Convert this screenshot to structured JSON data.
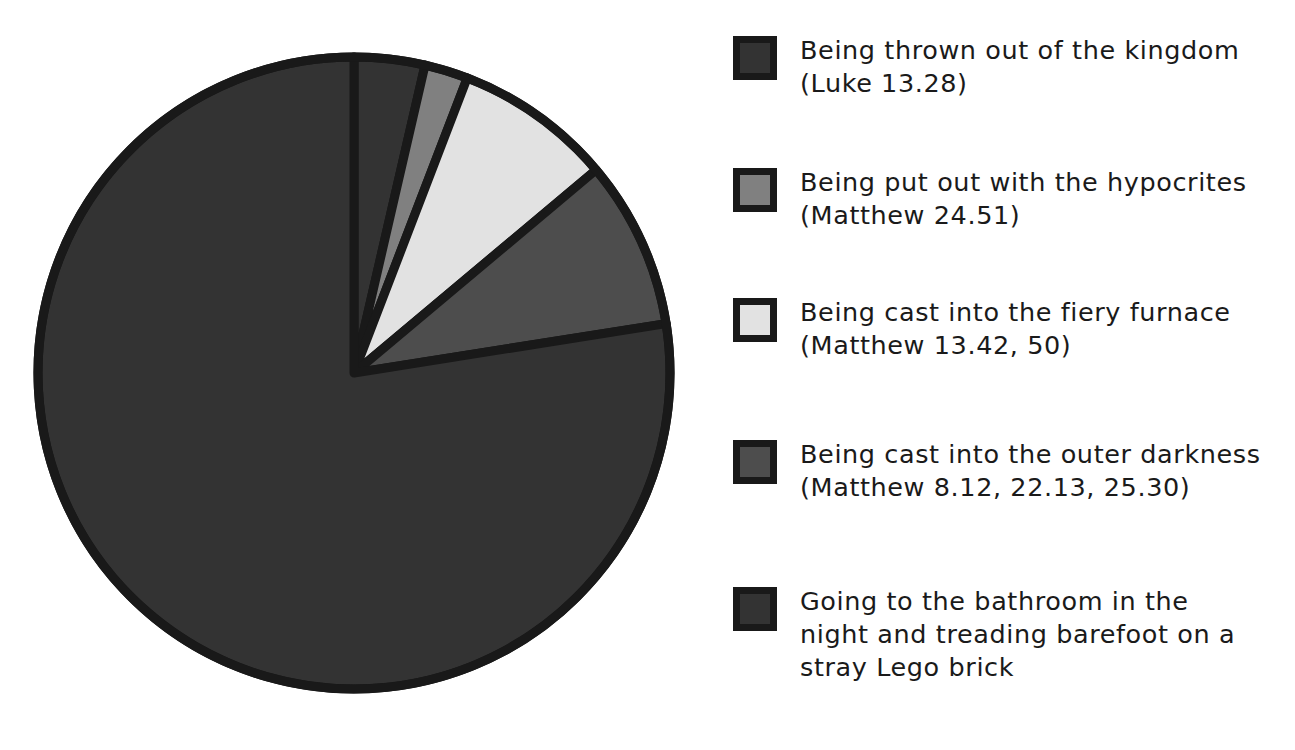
{
  "chart_data": {
    "type": "pie",
    "title": "",
    "subtitle": "",
    "xlabel": "",
    "ylabel": "",
    "legend_position": "right",
    "grid": false,
    "start_angle_deg": 0,
    "direction": "clockwise",
    "center": {
      "x": 354,
      "y": 373
    },
    "radius": 316,
    "categories": [
      "Being thrown out of the kingdom (Luke 13.28)",
      "Being put out with the hypocrites (Matthew 24.51)",
      "Being cast into the fiery furnace (Matthew 13.42, 50)",
      "Being cast into the outer darkness (Matthew 8.12, 22.13, 25.30)",
      "Going to the bathroom in the night and treading barefoot on a stray Lego brick"
    ],
    "values": [
      3.6,
      2.2,
      8.1,
      8.6,
      77.5
    ],
    "angles_deg": [
      13.0,
      8.0,
      29.0,
      31.0,
      279.0
    ],
    "colors": [
      "#333333",
      "#808080",
      "#e2e2e2",
      "#4d4d4d",
      "#333333"
    ],
    "stroke_color": "#191919",
    "stroke_width": 9
  },
  "legend": {
    "items": [
      {
        "line1": "Being thrown out of the kingdom",
        "line2": "(Luke 13.28)",
        "text": "Being thrown out of the kingdom\n(Luke 13.28)",
        "color": "#333333",
        "top": 0
      },
      {
        "line1": "Being put out with the hypocrites",
        "line2": "(Matthew 24.51)",
        "text": "Being put out with the hypocrites\n(Matthew 24.51)",
        "color": "#808080",
        "top": 132
      },
      {
        "line1": "Being cast into the fiery furnace",
        "line2": "(Matthew 13.42, 50)",
        "text": "Being cast into the fiery furnace\n(Matthew 13.42, 50)",
        "color": "#e2e2e2",
        "top": 262
      },
      {
        "line1": "Being cast into the outer darkness",
        "line2": "(Matthew 8.12, 22.13, 25.30)",
        "text": "Being cast into the outer darkness\n(Matthew 8.12, 22.13, 25.30)",
        "color": "#4d4d4d",
        "top": 404
      },
      {
        "line1": "Going to the bathroom in the",
        "line2": "night and treading barefoot on a",
        "line3": "stray Lego brick",
        "text": "Going to the bathroom in the\nnight and treading barefoot on a\nstray Lego brick",
        "color": "#333333",
        "top": 551
      }
    ]
  }
}
